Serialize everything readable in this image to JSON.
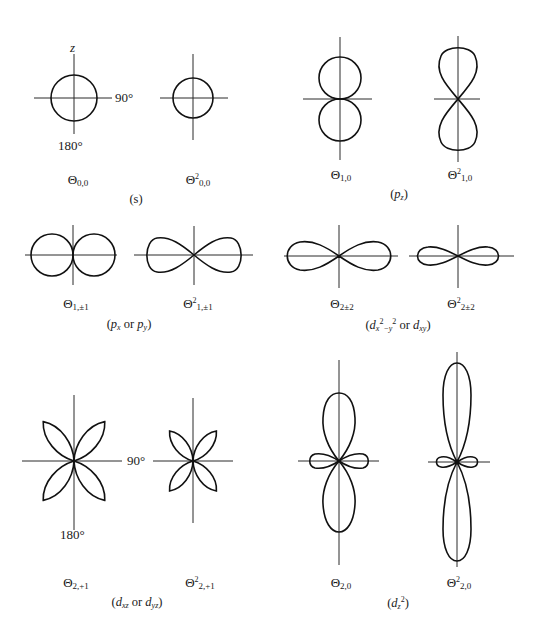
{
  "figure": {
    "axis_labels": {
      "z": "z",
      "deg90": "90°",
      "deg180": "180°"
    },
    "panels": [
      {
        "id": "s",
        "group_label": "(s)",
        "plots": [
          {
            "symbol": "Θ",
            "power": "",
            "sub": "0,0",
            "shape": "circle",
            "cx": 74,
            "cy": 98
          },
          {
            "symbol": "Θ",
            "power": "2",
            "sub": "0,0",
            "shape": "circle",
            "cx": 193,
            "cy": 98
          }
        ]
      },
      {
        "id": "pz",
        "group_label_main": "p",
        "group_label_sub": "z",
        "plots": [
          {
            "symbol": "Θ",
            "power": "",
            "sub": "1,0",
            "shape": "two-circles-vertical",
            "cx": 340,
            "cy": 99
          },
          {
            "symbol": "Θ",
            "power": "2",
            "sub": "1,0",
            "shape": "figure-eight-vertical",
            "cx": 458,
            "cy": 99
          }
        ]
      },
      {
        "id": "px_py",
        "group_label_a": "p",
        "group_label_a_sub": "x",
        "group_label_or": "or",
        "group_label_b": "p",
        "group_label_b_sub": "y",
        "plots": [
          {
            "symbol": "Θ",
            "power": "",
            "sub": "1,±1",
            "shape": "two-circles-horizontal",
            "cx": 73,
            "cy": 255
          },
          {
            "symbol": "Θ",
            "power": "2",
            "sub": "1,±1",
            "shape": "figure-eight-horizontal",
            "cx": 194,
            "cy": 255
          }
        ]
      },
      {
        "id": "dx2y2_dxy",
        "group_label_a": "d",
        "group_label_a_sub": "x",
        "group_label_a_sup1": "2",
        "group_label_a_mid": "−y",
        "group_label_a_sup2": "2",
        "group_label_or": "or",
        "group_label_b": "d",
        "group_label_b_sub": "xy",
        "plots": [
          {
            "symbol": "Θ",
            "power": "",
            "sub": "2±2",
            "shape": "figure-eight-horizontal",
            "cx": 339,
            "cy": 256
          },
          {
            "symbol": "Θ",
            "power": "2",
            "sub": "2±2",
            "shape": "figure-eight-horizontal-flat",
            "cx": 458,
            "cy": 256
          }
        ]
      },
      {
        "id": "dxz_dyz",
        "group_label_a": "d",
        "group_label_a_sub": "xz",
        "group_label_or": "or",
        "group_label_b": "d",
        "group_label_b_sub": "yz",
        "plots": [
          {
            "symbol": "Θ",
            "power": "",
            "sub": "2,+1",
            "shape": "four-leaf-clover",
            "cx": 74,
            "cy": 461
          },
          {
            "symbol": "Θ",
            "power": "2",
            "sub": "2,+1",
            "shape": "four-leaf-clover-small",
            "cx": 193,
            "cy": 461
          }
        ]
      },
      {
        "id": "dz2",
        "group_label_a": "d",
        "group_label_a_sub": "z",
        "group_label_a_sup": "2",
        "plots": [
          {
            "symbol": "Θ",
            "power": "",
            "sub": "2,0",
            "shape": "dz2-lobes",
            "cx": 339,
            "cy": 461
          },
          {
            "symbol": "Θ",
            "power": "2",
            "sub": "2,0",
            "shape": "dz2-lobes-elongated",
            "cx": 457,
            "cy": 462
          }
        ]
      }
    ]
  }
}
